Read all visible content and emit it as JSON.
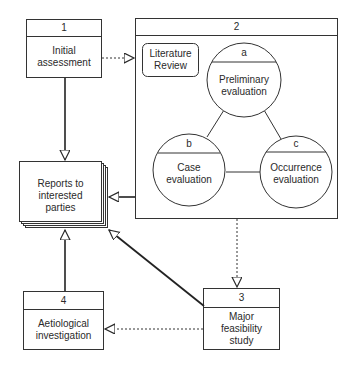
{
  "diagram": {
    "stroke_color": "#2a2a2a",
    "background": "#ffffff",
    "nodes": {
      "box1": {
        "number": "1",
        "label_line1": "Initial",
        "label_line2": "assessment"
      },
      "box2": {
        "number": "2"
      },
      "literature_review": {
        "label_line1": "Literature",
        "label_line2": "Review"
      },
      "circle_a": {
        "letter": "a",
        "label_line1": "Preliminary",
        "label_line2": "evaluation"
      },
      "circle_b": {
        "letter": "b",
        "label_line1": "Case",
        "label_line2": "evaluation"
      },
      "circle_c": {
        "letter": "c",
        "label_line1": "Occurrence",
        "label_line2": "evaluation"
      },
      "reports": {
        "label_line1": "Reports to",
        "label_line2": "interested",
        "label_line3": "parties"
      },
      "box3": {
        "number": "3",
        "label_line1": "Major",
        "label_line2": "feasibility",
        "label_line3": "study"
      },
      "box4": {
        "number": "4",
        "label_line1": "Aetiological",
        "label_line2": "investigation"
      }
    },
    "edges": [
      {
        "from": "box1",
        "to": "box2",
        "style": "dotted"
      },
      {
        "from": "box1",
        "to": "reports",
        "style": "solid"
      },
      {
        "from": "box2",
        "to": "reports",
        "style": "solid"
      },
      {
        "from": "box2",
        "to": "box3",
        "style": "dotted"
      },
      {
        "from": "box3",
        "to": "reports",
        "style": "solid"
      },
      {
        "from": "box3",
        "to": "box4",
        "style": "dotted"
      },
      {
        "from": "box4",
        "to": "reports",
        "style": "solid"
      },
      {
        "from": "circle_a",
        "to": "circle_b",
        "style": "line"
      },
      {
        "from": "circle_a",
        "to": "circle_c",
        "style": "line"
      },
      {
        "from": "circle_b",
        "to": "circle_c",
        "style": "line"
      }
    ]
  }
}
